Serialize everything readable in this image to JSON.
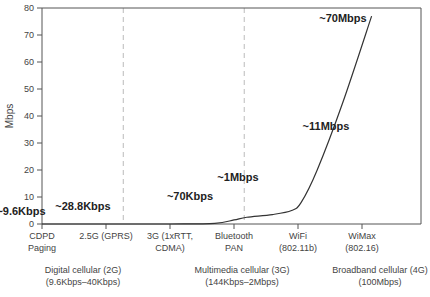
{
  "chart_data": {
    "type": "line",
    "title": "",
    "xlabel": "",
    "ylabel": "Mbps",
    "ylim": [
      0,
      80
    ],
    "yticks": [
      0,
      10,
      20,
      30,
      40,
      50,
      60,
      70,
      80
    ],
    "grid": false,
    "legend": null,
    "categories": [
      {
        "line1": "CDPD",
        "line2": "Paging"
      },
      {
        "line1": "2.5G (GPRS)",
        "line2": ""
      },
      {
        "line1": "3G (1xRTT,",
        "line2": "CDMA)"
      },
      {
        "line1": "Bluetooth",
        "line2": "PAN"
      },
      {
        "line1": "WiFi",
        "line2": "(802.11b)"
      },
      {
        "line1": "WiMax",
        "line2": "(802.16)"
      }
    ],
    "series": [
      {
        "name": "Data rate",
        "points": [
          {
            "x": 0,
            "y": 0
          },
          {
            "x": 1,
            "y": 0
          },
          {
            "x": 2,
            "y": 0
          },
          {
            "x": 2.7,
            "y": 0.2
          },
          {
            "x": 3.0,
            "y": 1.5
          },
          {
            "x": 3.2,
            "y": 2.5
          },
          {
            "x": 3.6,
            "y": 3.5
          },
          {
            "x": 3.9,
            "y": 5
          },
          {
            "x": 4.05,
            "y": 8
          },
          {
            "x": 4.3,
            "y": 20
          },
          {
            "x": 4.7,
            "y": 45
          },
          {
            "x": 5.15,
            "y": 77
          }
        ]
      }
    ],
    "annotations": [
      {
        "text": "~9.6Kbps",
        "x": 0,
        "y": 4
      },
      {
        "text": "~28.8Kbps",
        "x": 1,
        "y": 7
      },
      {
        "text": "~70Kbps",
        "x": 2,
        "y": 19
      },
      {
        "text": "~1Mbps",
        "x": 3,
        "y": 17
      },
      {
        "text": "~11Mbps",
        "x": 4,
        "y": 34
      },
      {
        "text": "~70Mbps",
        "x": 5,
        "y": 74
      }
    ],
    "dividers": [
      {
        "x": 1.27,
        "style": "dashed"
      },
      {
        "x": 3.16,
        "style": "dashed"
      }
    ],
    "groups": [
      {
        "line1": "Digital cellular (2G)",
        "line2": "(9.6Kbps–40Kbps)"
      },
      {
        "line1": "Multimedia cellular (3G)",
        "line2": "(144Kbps–2Mbps)"
      },
      {
        "line1": "Broadband cellular (4G)",
        "line2": "(100Mbps)"
      }
    ]
  },
  "colors": {
    "axis": "#555555",
    "curve": "#333333",
    "divider": "#bbbbbb"
  }
}
